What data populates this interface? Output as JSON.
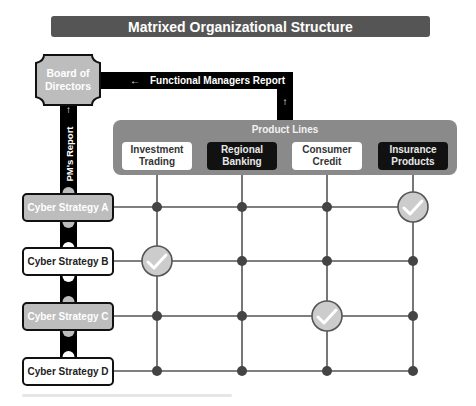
{
  "title": "Matrixed Organizational Structure",
  "board": {
    "label_line1": "Board of",
    "label_line2": "Directors",
    "fill": "#bdbdbd"
  },
  "connectors": {
    "functional_managers_report": "Functional Managers Report",
    "pm_report": "PM's Report",
    "arrow_left_icon": "←",
    "arrow_up_icon": "↑"
  },
  "product_lines": {
    "title": "Product Lines",
    "items": [
      {
        "line1": "Investment",
        "line2": "Trading",
        "style": "light"
      },
      {
        "line1": "Regional",
        "line2": "Banking",
        "style": "dark"
      },
      {
        "line1": "Consumer",
        "line2": "Credit",
        "style": "light"
      },
      {
        "line1": "Insurance",
        "line2": "Products",
        "style": "dark"
      }
    ]
  },
  "strategies": [
    {
      "label": "Cyber Strategy A",
      "style": "grey"
    },
    {
      "label": "Cyber Strategy B",
      "style": "white"
    },
    {
      "label": "Cyber Strategy C",
      "style": "grey"
    },
    {
      "label": "Cyber Strategy D",
      "style": "white"
    }
  ],
  "matrix_checks": [
    {
      "strategy": "Cyber Strategy A",
      "product": "Insurance Products"
    },
    {
      "strategy": "Cyber Strategy B",
      "product": "Investment Trading"
    },
    {
      "strategy": "Cyber Strategy C",
      "product": "Consumer Credit"
    }
  ],
  "colors": {
    "title_bar": "#555555",
    "panel": "#8a8a8a",
    "grid_line": "#555555",
    "node": "#444444",
    "check_circle": "#cccccc",
    "connector": "#000000"
  }
}
